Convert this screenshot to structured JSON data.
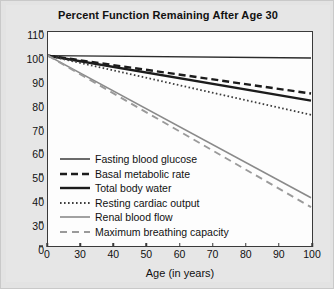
{
  "chart_data": {
    "type": "line",
    "title": "Percent Function Remaining After Age 30",
    "xlabel": "Age (in years)",
    "ylabel": "",
    "xlim": [
      0,
      100
    ],
    "ylim": [
      0,
      110
    ],
    "grid": false,
    "legend_position": "inside-lower-left",
    "x_ticks": [
      0,
      30,
      40,
      50,
      60,
      70,
      80,
      90,
      100
    ],
    "y_ticks": [
      0,
      30,
      40,
      50,
      60,
      70,
      80,
      90,
      100,
      110
    ],
    "y_axis_break_between": [
      0,
      30
    ],
    "x_axis_break_between": [
      0,
      30
    ],
    "x": [
      0,
      100
    ],
    "series": [
      {
        "name": "Fasting blood glucose",
        "style": "solid-thin",
        "color": "#2b2b2b",
        "values": [
          100,
          99
        ]
      },
      {
        "name": "Basal metabolic rate",
        "style": "dashed-bold",
        "color": "#1c1c1c",
        "values": [
          100,
          84
        ]
      },
      {
        "name": "Total body water",
        "style": "solid-bold",
        "color": "#1c1c1c",
        "values": [
          100,
          81
        ]
      },
      {
        "name": "Resting cardiac output",
        "style": "dotted",
        "color": "#3d3d3d",
        "values": [
          100,
          75
        ]
      },
      {
        "name": "Renal blood flow",
        "style": "solid-gray",
        "color": "#8a8a8a",
        "values": [
          100,
          40
        ]
      },
      {
        "name": "Maximum breathing capacity",
        "style": "dashed-gray",
        "color": "#9a9a9a",
        "values": [
          100,
          36
        ]
      }
    ]
  },
  "legend": {
    "items": [
      {
        "label": "Fasting blood glucose"
      },
      {
        "label": "Basal metabolic rate"
      },
      {
        "label": "Total body water"
      },
      {
        "label": "Resting cardiac output"
      },
      {
        "label": "Renal blood flow"
      },
      {
        "label": "Maximum breathing capacity"
      }
    ]
  },
  "axis": {
    "y_labels": [
      "110",
      "100",
      "90",
      "80",
      "70",
      "60",
      "50",
      "40",
      "30",
      "0"
    ],
    "x_labels": [
      "0",
      "30",
      "40",
      "50",
      "60",
      "70",
      "80",
      "90",
      "100"
    ]
  }
}
